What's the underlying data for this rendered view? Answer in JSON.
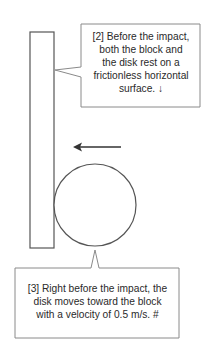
{
  "diagram": {
    "colors": {
      "stroke": "#555555",
      "box_stroke": "#8a8a8a",
      "text": "#2a2a2a",
      "background": "#ffffff"
    },
    "block": {
      "x": 30,
      "y": 32,
      "width": 24,
      "height": 216
    },
    "disk": {
      "cx": 95,
      "cy": 205,
      "r": 41
    },
    "arrow": {
      "x1": 121,
      "y1": 147,
      "x2": 74,
      "y2": 147,
      "direction": "left"
    },
    "callouts": [
      {
        "id": "top",
        "lines": [
          "[2] Before the impact,",
          "both the block and",
          "the disk rest on a",
          "frictionless  horizontal",
          "surface. ↓"
        ]
      },
      {
        "id": "bottom",
        "lines": [
          "[3] Right before the impact, the",
          "disk moves toward the block",
          "with a velocity of 0.5 m/s.  #"
        ]
      }
    ]
  }
}
